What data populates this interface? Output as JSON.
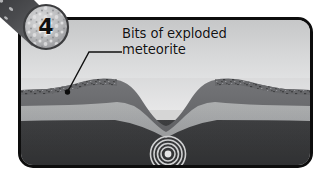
{
  "figure": {
    "step_number": "4",
    "caption_line1": "Bits of exploded",
    "caption_line2": "meteorite",
    "caption_text": "Bits of exploded\nmeteorite"
  },
  "scene": {
    "title": "meteorite impact crater cross-section",
    "sky_top_color": "#c9cacb",
    "sky_bottom_color": "#e9eaea",
    "topsoil_color": "#6f7072",
    "midlayer_color": "#a9abac",
    "bedrock_color": "#3a3b3d",
    "debris_color": "#55565a",
    "shockwave_color": "#cfd0d1",
    "frame_border_color": "#0d0d0d",
    "leader_line_color": "#101010",
    "shockwave_rings": "5",
    "layers": [
      {
        "name": "sky",
        "label": "sky"
      },
      {
        "name": "ejecta-rim-left",
        "label": "raised crater rim (left)"
      },
      {
        "name": "ejecta-rim-right",
        "label": "raised crater rim (right)"
      },
      {
        "name": "crater-bowl",
        "label": "crater bowl"
      },
      {
        "name": "topsoil-layer",
        "label": "upper rock layer"
      },
      {
        "name": "mid-rock-layer",
        "label": "middle rock layer"
      },
      {
        "name": "bedrock-layer",
        "label": "bedrock"
      },
      {
        "name": "shockwave",
        "label": "shockwave rings"
      }
    ]
  }
}
